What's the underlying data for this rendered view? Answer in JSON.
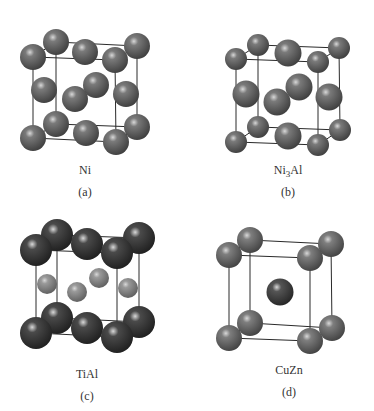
{
  "figure": {
    "panels": [
      {
        "id": "a",
        "compound": "Ni",
        "compound_parts": [
          {
            "t": "Ni",
            "sub": false
          }
        ],
        "letter": "(a)",
        "structure": "fcc",
        "atom_types": {
          "Ni": {
            "color": "#7a7a7a",
            "dark": "#3a3a3a"
          }
        },
        "corner_atom": "Ni",
        "face_atom": "Ni"
      },
      {
        "id": "b",
        "compound": "Ni3Al",
        "compound_parts": [
          {
            "t": "Ni",
            "sub": false
          },
          {
            "t": "3",
            "sub": true
          },
          {
            "t": "Al",
            "sub": false
          }
        ],
        "letter": "(b)",
        "structure": "L1_2",
        "atom_types": {
          "corner": {
            "color": "#7a7a7a",
            "dark": "#3a3a3a"
          },
          "face": {
            "color": "#7a7a7a",
            "dark": "#3a3a3a"
          }
        },
        "corner_atom": "corner",
        "face_atom": "face"
      },
      {
        "id": "c",
        "compound": "TiAl",
        "compound_parts": [
          {
            "t": "TiAl",
            "sub": false
          }
        ],
        "letter": "(c)",
        "structure": "L1_0",
        "atom_types": {
          "Ti": {
            "color": "#4a4a4a",
            "dark": "#1c1c1c"
          },
          "Al": {
            "color": "#9a9a9a",
            "dark": "#5a5a5a"
          }
        },
        "corner_atom": "Ti",
        "face_atom": "Al"
      },
      {
        "id": "d",
        "compound": "CuZn",
        "compound_parts": [
          {
            "t": "CuZn",
            "sub": false
          }
        ],
        "letter": "(d)",
        "structure": "B2",
        "atom_types": {
          "Cu": {
            "color": "#7e7e7e",
            "dark": "#3e3e3e"
          },
          "Zn": {
            "color": "#555555",
            "dark": "#222222"
          }
        },
        "corner_atom": "Cu",
        "center_atom": "Zn"
      }
    ],
    "line_color": "#2a2a2a"
  }
}
